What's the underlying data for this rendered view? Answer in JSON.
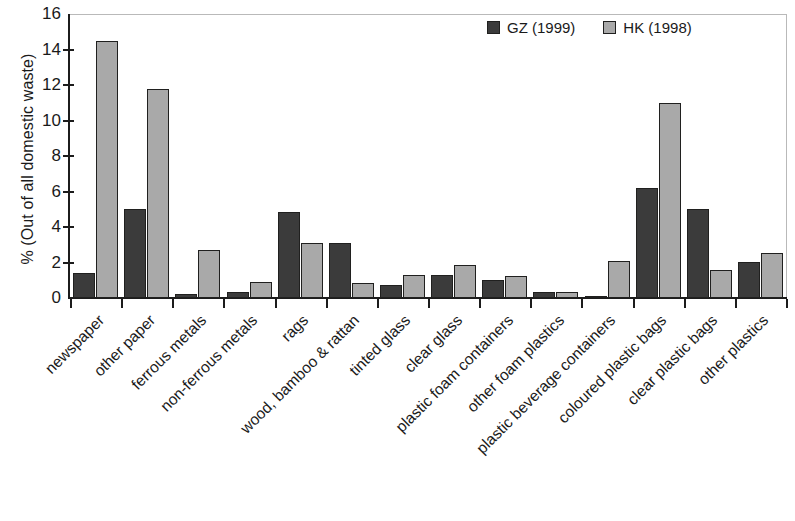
{
  "chart_data": {
    "type": "bar",
    "title": "",
    "xlabel": "",
    "ylabel": "% (Out of all domestic waste)",
    "ylim": [
      0,
      16
    ],
    "ytick_labels": [
      "16",
      "14",
      "12",
      "10",
      "8",
      "6",
      "4",
      "2",
      "0"
    ],
    "ytick_values": [
      16,
      14,
      12,
      10,
      8,
      6,
      4,
      2,
      0
    ],
    "grid": false,
    "legend_position": "top-right",
    "categories": [
      "newspaper",
      "other paper",
      "ferrous metals",
      "non-ferrous metals",
      "rags",
      "wood, bamboo & rattan",
      "tinted glass",
      "clear glass",
      "plastic foam containers",
      "other foam plastics",
      "plastic beverage containers",
      "coloured plastic bags",
      "clear plastic bags",
      "other plastics"
    ],
    "series": [
      {
        "name": "GZ (1999)",
        "color": "#3b3b3b",
        "values": [
          1.4,
          5.0,
          0.25,
          0.35,
          4.85,
          3.1,
          0.75,
          1.3,
          1.0,
          0.35,
          0.1,
          6.2,
          5.0,
          2.05
        ]
      },
      {
        "name": "HK (1998)",
        "color": "#a9a9a9",
        "values": [
          14.5,
          11.8,
          2.7,
          0.9,
          3.1,
          0.85,
          1.3,
          1.85,
          1.25,
          0.35,
          2.1,
          11.0,
          1.6,
          2.55
        ]
      }
    ]
  },
  "legend": {
    "entries": [
      {
        "label": "GZ (1999)",
        "swatch": "gz"
      },
      {
        "label": "HK (1998)",
        "swatch": "hk"
      }
    ]
  }
}
